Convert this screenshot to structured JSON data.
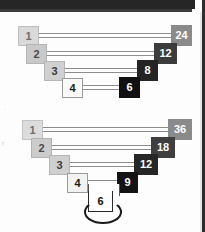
{
  "diagram": {
    "background_color": "#fdfdfd",
    "line_color": "#8c8c8c",
    "charts": [
      {
        "id": "factors-of-24",
        "number": 24,
        "caption": "",
        "pairs": [
          {
            "left": "1",
            "right": "24",
            "left_fill": "#d9d9d9",
            "left_text": "#6e6e6e",
            "right_fill": "#8a8a8a",
            "right_text": "#ffffff"
          },
          {
            "left": "2",
            "right": "12",
            "left_fill": "#c9c9c9",
            "left_text": "#4a4a4a",
            "right_fill": "#3c3c3c",
            "right_text": "#ffffff"
          },
          {
            "left": "3",
            "right": "8",
            "left_fill": "#d0d0d0",
            "left_text": "#3a3a3a",
            "right_fill": "#242424",
            "right_text": "#ffffff"
          },
          {
            "left": "4",
            "right": "6",
            "left_fill": "#fbfbfb",
            "left_text": "#1a1a1a",
            "right_fill": "#111111",
            "right_text": "#ffffff"
          }
        ]
      },
      {
        "id": "factors-of-36",
        "number": 36,
        "caption": "",
        "pairs": [
          {
            "left": "1",
            "right": "36",
            "left_fill": "#dcdcdc",
            "left_text": "#6e6e6e",
            "right_fill": "#8a8a8a",
            "right_text": "#ffffff"
          },
          {
            "left": "2",
            "right": "18",
            "left_fill": "#cccccc",
            "left_text": "#4a4a4a",
            "right_fill": "#3f3f3f",
            "right_text": "#ffffff"
          },
          {
            "left": "3",
            "right": "12",
            "left_fill": "#cfcfcf",
            "left_text": "#3a3a3a",
            "right_fill": "#262626",
            "right_text": "#ffffff"
          },
          {
            "left": "4",
            "right": "9",
            "left_fill": "#f2f2f2",
            "left_text": "#1a1a1a",
            "right_fill": "#131313",
            "right_text": "#ffffff"
          }
        ],
        "self_pair": {
          "value": "6",
          "fill": "#ffffff",
          "text": "#111111",
          "loop": true
        }
      }
    ],
    "margin_marks": [
      "r"
    ]
  }
}
